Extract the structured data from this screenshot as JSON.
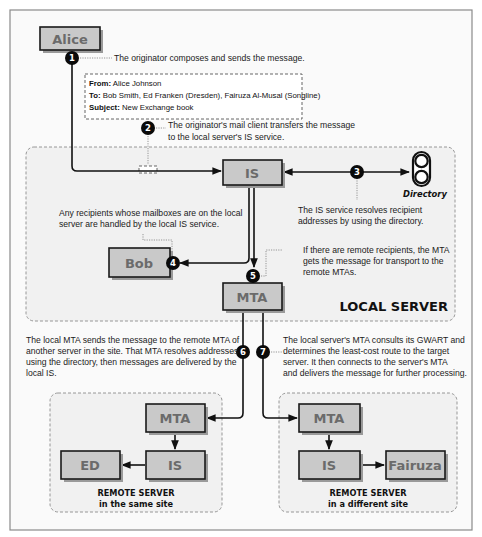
{
  "diagram": {
    "nodes": {
      "alice": "Alice",
      "local_is": "IS",
      "bob": "Bob",
      "local_mta": "MTA",
      "remote1_mta": "MTA",
      "remote1_is": "IS",
      "ed": "ED",
      "remote2_mta": "MTA",
      "remote2_is": "IS",
      "fairuza": "Fairuza"
    },
    "directory": {
      "label": "Directory",
      "icon": "directory-icon"
    },
    "message": {
      "from_label": "From:",
      "from_value": " Alice Johnson",
      "to_label": "To:",
      "to_value": " Bob Smith, Ed Franken (Dresden), Fairuza Al-Musal (Songline)",
      "subject_label": "Subject:",
      "subject_value": " New Exchange book"
    },
    "markers": [
      "1",
      "2",
      "3",
      "4",
      "5",
      "6",
      "7"
    ],
    "notes": {
      "n1": [
        "The originator composes and sends the message."
      ],
      "n2": [
        "The originator's mail client transfers the message",
        "to the local server's IS service."
      ],
      "n3": [
        "The IS service resolves recipient",
        "addresses by using the directory."
      ],
      "n4": [
        "Any recipients whose mailboxes are on the local",
        "server are handled by the local IS service."
      ],
      "n5": [
        "If there are remote recipients, the MTA",
        "gets the message for transport to the",
        "remote MTAs."
      ],
      "n6": [
        "The local MTA sends the message to the remote MTA of",
        "another server in the site. That MTA resolves addresses",
        "using the directory, then messages are delivered by the",
        "local IS."
      ],
      "n7": [
        "The local server's MTA consults its GWART and",
        "determines the least-cost route to the target",
        "server. It then connects to the server's MTA",
        "and delivers the message for further processing."
      ]
    },
    "regions": {
      "local": {
        "title": "LOCAL SERVER"
      },
      "remote_same": {
        "line1": "REMOTE SERVER",
        "line2": "in the same site"
      },
      "remote_diff": {
        "line1": "REMOTE SERVER",
        "line2": "in a different site"
      }
    },
    "colors": {
      "node_fill": "#c9c9c9",
      "node_text": "#6b6b6b",
      "region_fill": "#f1f1f1",
      "marker": "#0a0a0a"
    }
  }
}
